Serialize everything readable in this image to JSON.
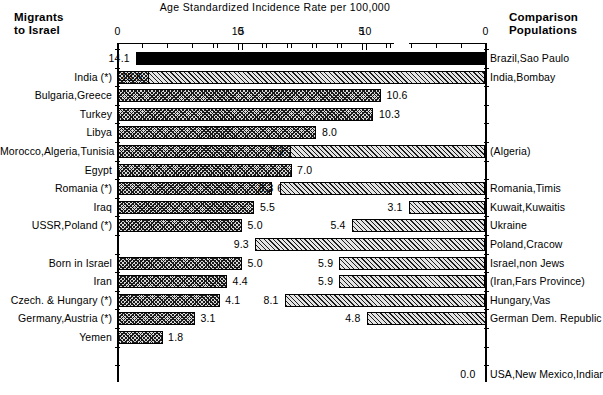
{
  "chart_data": {
    "type": "bar",
    "title": "Age Standardized Incidence Rate per 100,000",
    "xlabel": "Age Standardized Incidence Rate per 100,000",
    "ylabel": "",
    "orientation": "horizontal",
    "grid": false,
    "legend": null,
    "panels": [
      {
        "name": "migrants-to-israel",
        "header": "Migrants\nto Israel",
        "header_line1": "Migrants",
        "header_line2": "to Israel",
        "direction": "left-to-right",
        "axis_ticks_major": [
          0,
          5,
          10
        ],
        "axis_tick_labels": [
          "0",
          "5",
          "10"
        ],
        "axis_minor_step": 1,
        "xlim": [
          0,
          15
        ],
        "categories": [
          "India (*)",
          "Bulgaria,Greece",
          "Turkey",
          "Libya",
          "Morocco,Algeria,Tunisia",
          "Egypt",
          "Romania (*)",
          "Iraq",
          "USSR,Poland (*)",
          "Born in Israel",
          "Iran",
          "Czech. & Hungary (*)",
          "Germany,Austria (*)",
          "Yemen"
        ],
        "values": [
          11.3,
          10.6,
          10.3,
          8.0,
          7.1,
          7.0,
          6.2,
          5.5,
          5.0,
          5.0,
          4.4,
          4.1,
          3.1,
          1.8
        ],
        "value_labels": [
          "11.3",
          "10.6",
          "10.3",
          "8.0",
          "7.1",
          "7.0",
          "6.2",
          "5.5",
          "5.0",
          "5.0",
          "4.4",
          "4.1",
          "3.1",
          "1.8"
        ]
      },
      {
        "name": "comparison-populations",
        "header": "Comparison\nPopulations",
        "header_line1": "Comparison",
        "header_line2": "Populations",
        "direction": "right-to-left",
        "axis_ticks_major": [
          10,
          5,
          0
        ],
        "axis_tick_labels": [
          "10",
          "5",
          "0"
        ],
        "axis_minor_step": 1,
        "xlim": [
          0,
          15
        ],
        "categories": [
          "Brazil,Sao Paulo",
          "India,Bombay",
          "(Algeria)",
          "Romania,Timis",
          "Kuwait,Kuwaitis",
          "Ukraine",
          "Poland,Cracow",
          "Israel,non Jews",
          "(Iran,Fars Province)",
          "Hungary,Vas",
          "German Dem. Republic",
          "USA,New Mexico,Indian"
        ],
        "values": [
          14.1,
          13.6,
          7.9,
          8.3,
          3.1,
          5.4,
          9.3,
          5.9,
          5.9,
          8.1,
          4.8,
          0.0
        ],
        "value_labels": [
          "14.1",
          "13.6",
          "7.9",
          "8.3",
          "3.1",
          "5.4",
          "9.3",
          "5.9",
          "5.9",
          "8.1",
          "4.8",
          "0.0"
        ]
      }
    ],
    "rows": [
      {
        "index": 0,
        "left_label": "",
        "left_value": null,
        "right_label": "Brazil,Sao Paulo",
        "right_value": 14.1,
        "right_value_label": "14.1",
        "right_style": "solid"
      },
      {
        "index": 1,
        "left_label": "India (*)",
        "left_value": 11.3,
        "left_value_label": "11.3",
        "right_label": "India,Bombay",
        "right_value": 13.6,
        "right_value_label": "13.6",
        "right_style": "hatch"
      },
      {
        "index": 2,
        "left_label": "Bulgaria,Greece",
        "left_value": 10.6,
        "left_value_label": "10.6",
        "right_label": "",
        "right_value": null
      },
      {
        "index": 3,
        "left_label": "Turkey",
        "left_value": 10.3,
        "left_value_label": "10.3",
        "right_label": "",
        "right_value": null
      },
      {
        "index": 4,
        "left_label": "Libya",
        "left_value": 8.0,
        "left_value_label": "8.0",
        "right_label": "",
        "right_value": null
      },
      {
        "index": 5,
        "left_label": "Morocco,Algeria,Tunisia",
        "left_value": 7.1,
        "left_value_label": "7.1",
        "right_label": "(Algeria)",
        "right_value": 7.9,
        "right_value_label": "7.9",
        "right_style": "hatch"
      },
      {
        "index": 6,
        "left_label": "Egypt",
        "left_value": 7.0,
        "left_value_label": "7.0",
        "right_label": "",
        "right_value": null
      },
      {
        "index": 7,
        "left_label": "Romania (*)",
        "left_value": 6.2,
        "left_value_label": "6.2",
        "right_label": "Romania,Timis",
        "right_value": 8.3,
        "right_value_label": "8.3",
        "right_style": "hatch"
      },
      {
        "index": 8,
        "left_label": "Iraq",
        "left_value": 5.5,
        "left_value_label": "5.5",
        "right_label": "Kuwait,Kuwaitis",
        "right_value": 3.1,
        "right_value_label": "3.1",
        "right_style": "hatch"
      },
      {
        "index": 9,
        "left_label": "USSR,Poland (*)",
        "left_value": 5.0,
        "left_value_label": "5.0",
        "right_label": "Ukraine",
        "right_value": 5.4,
        "right_value_label": "5.4",
        "right_style": "hatch"
      },
      {
        "index": 10,
        "left_label": "",
        "left_value": null,
        "right_label": "Poland,Cracow",
        "right_value": 9.3,
        "right_value_label": "9.3",
        "right_style": "hatch"
      },
      {
        "index": 11,
        "left_label": "Born in Israel",
        "left_value": 5.0,
        "left_value_label": "5.0",
        "right_label": "Israel,non Jews",
        "right_value": 5.9,
        "right_value_label": "5.9",
        "right_style": "hatch"
      },
      {
        "index": 12,
        "left_label": "Iran",
        "left_value": 4.4,
        "left_value_label": "4.4",
        "right_label": "(Iran,Fars Province)",
        "right_value": 5.9,
        "right_value_label": "5.9",
        "right_style": "hatch"
      },
      {
        "index": 13,
        "left_label": "Czech. & Hungary (*)",
        "left_value": 4.1,
        "left_value_label": "4.1",
        "right_label": "Hungary,Vas",
        "right_value": 8.1,
        "right_value_label": "8.1",
        "right_style": "hatch"
      },
      {
        "index": 14,
        "left_label": "Germany,Austria (*)",
        "left_value": 3.1,
        "left_value_label": "3.1",
        "right_label": "German Dem. Republic",
        "right_value": 4.8,
        "right_value_label": "4.8",
        "right_style": "hatch"
      },
      {
        "index": 15,
        "left_label": "Yemen",
        "left_value": 1.8,
        "left_value_label": "1.8",
        "right_label": "",
        "right_value": null
      },
      {
        "index": 16,
        "left_label": "",
        "left_value": null,
        "right_label": "",
        "right_value": null
      },
      {
        "index": 17,
        "left_label": "",
        "left_value": null,
        "right_label": "USA,New Mexico,Indian",
        "right_value": 0.0,
        "right_value_label": "0.0",
        "right_style": "none"
      }
    ],
    "colors": {
      "axis": "#000000",
      "bar_outline": "#000000",
      "bar_hatch": "#1a1a1a",
      "bar_fill": "#d8d8d8",
      "solid_bar": "#000000",
      "background": "#ffffff"
    }
  }
}
